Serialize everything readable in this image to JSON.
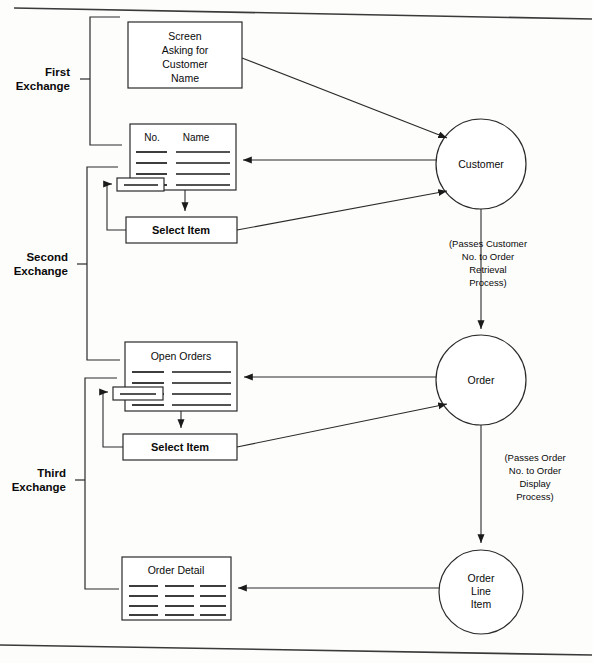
{
  "figure": {
    "type": "dataflow-diagram",
    "background": "#fdfdfc",
    "line_color": "#2a2a2a"
  },
  "exchanges": [
    {
      "id": "first",
      "line1": "First",
      "line2": "Exchange"
    },
    {
      "id": "second",
      "line1": "Second",
      "line2": "Exchange"
    },
    {
      "id": "third",
      "line1": "Third",
      "line2": "Exchange"
    }
  ],
  "boxes": {
    "screen_prompt": {
      "lines": [
        "Screen",
        "Asking for",
        "Customer",
        "Name"
      ]
    },
    "customer_list": {
      "col1": "No.",
      "col2": "Name"
    },
    "select_item_1": {
      "label": "Select Item"
    },
    "open_orders": {
      "title": "Open Orders"
    },
    "select_item_2": {
      "label": "Select Item"
    },
    "order_detail": {
      "title": "Order Detail"
    }
  },
  "processes": [
    {
      "id": "customer",
      "lines": [
        "Customer"
      ]
    },
    {
      "id": "order",
      "lines": [
        "Order"
      ]
    },
    {
      "id": "order_line",
      "lines": [
        "Order",
        "Line",
        "Item"
      ]
    }
  ],
  "annotations": {
    "customer_to_order": {
      "lines": [
        "(Passes Customer",
        "No. to Order",
        "Retrieval",
        "Process)"
      ]
    },
    "order_to_line_item": {
      "lines": [
        "(Passes Order",
        "No. to Order",
        "Display",
        "Process)"
      ]
    }
  }
}
